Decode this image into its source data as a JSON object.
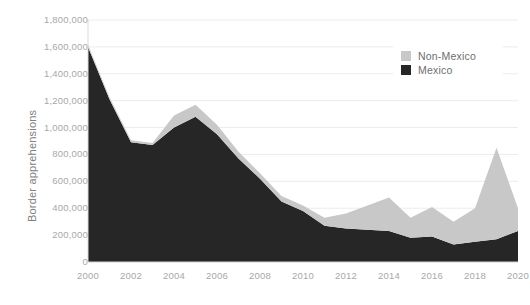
{
  "chart_data": {
    "type": "area",
    "stacked": true,
    "title": "",
    "subtitle": "",
    "xlabel": "",
    "ylabel": "Border apprehensions",
    "x": [
      2000,
      2001,
      2002,
      2003,
      2004,
      2005,
      2006,
      2007,
      2008,
      2009,
      2010,
      2011,
      2012,
      2013,
      2014,
      2015,
      2016,
      2017,
      2018,
      2019,
      2020
    ],
    "xticklabels": [
      "2000",
      "2002",
      "2004",
      "2006",
      "2008",
      "2010",
      "2012",
      "2014",
      "2016",
      "2018",
      "2020"
    ],
    "xlim": [
      2000,
      2020
    ],
    "ylim": [
      0,
      1800000
    ],
    "yticks": [
      0,
      200000,
      400000,
      600000,
      800000,
      1000000,
      1200000,
      1400000,
      1600000,
      1800000
    ],
    "yticklabels": [
      "0",
      "200,000",
      "400,000",
      "600,000",
      "800,000",
      "1,000,000",
      "1,200,000",
      "1,400,000",
      "1,600,000",
      "1,800,000"
    ],
    "grid": true,
    "legend_position": "top-right",
    "series": [
      {
        "name": "Mexico",
        "color": "#262626",
        "values": [
          1600000,
          1210000,
          890000,
          870000,
          1000000,
          1080000,
          950000,
          770000,
          620000,
          450000,
          380000,
          270000,
          250000,
          240000,
          230000,
          180000,
          190000,
          130000,
          150000,
          170000,
          230000
        ]
      },
      {
        "name": "Non-Mexico",
        "color": "#c8c8c8",
        "values": [
          15000,
          15000,
          15000,
          15000,
          90000,
          90000,
          70000,
          50000,
          40000,
          40000,
          40000,
          60000,
          110000,
          180000,
          250000,
          150000,
          220000,
          170000,
          250000,
          680000,
          170000
        ]
      }
    ],
    "totals": [
      1615000,
      1225000,
      905000,
      885000,
      1090000,
      1170000,
      1020000,
      820000,
      660000,
      490000,
      420000,
      330000,
      360000,
      420000,
      480000,
      330000,
      410000,
      300000,
      400000,
      850000,
      400000
    ]
  },
  "legend": {
    "items": [
      {
        "label": "Non-Mexico",
        "color": "#c8c8c8"
      },
      {
        "label": "Mexico",
        "color": "#262626"
      }
    ]
  }
}
